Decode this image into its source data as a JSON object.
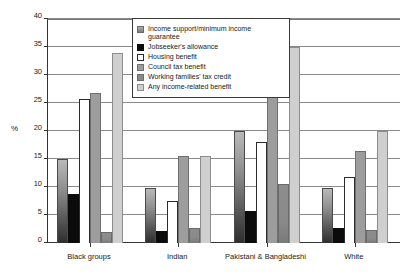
{
  "chart_data": {
    "type": "bar",
    "title": "",
    "subtitle": "",
    "xlabel": "",
    "ylabel": "%",
    "ylim": [
      0,
      40
    ],
    "ytick_step": 5,
    "yticks": [
      "0",
      "5",
      "10",
      "15",
      "20",
      "25",
      "30",
      "35",
      "40"
    ],
    "grid": true,
    "legend_position": "top-right-inside",
    "categories": [
      "Black groups",
      "Indian",
      "Pakistani & Bangladeshi",
      "White"
    ],
    "series": [
      {
        "name": "Income support/minimum income guarantee",
        "color": "#8f8f8f",
        "values": [
          15.0,
          9.9,
          20.0,
          9.9
        ]
      },
      {
        "name": "Jobseeker's allowance",
        "color": "#0b0b0b",
        "values": [
          8.8,
          2.2,
          5.7,
          2.7
        ]
      },
      {
        "name": "Housing benefit",
        "color": "#ffffff",
        "values": [
          25.8,
          7.5,
          18.0,
          11.8
        ]
      },
      {
        "name": "Council tax benefit",
        "color": "#9d9d9d",
        "values": [
          26.7,
          15.5,
          29.0,
          16.5
        ]
      },
      {
        "name": "Working families' tax credit",
        "color": "#8a8a8a",
        "values": [
          2.0,
          2.7,
          10.6,
          2.3
        ]
      },
      {
        "name": "Any income-related benefit",
        "color": "#cfcfcf",
        "values": [
          33.9,
          15.5,
          35.0,
          20.0
        ]
      }
    ]
  },
  "axis": {
    "y_title": "%"
  },
  "legend": {
    "items": [
      {
        "label": "Income support/minimum income guarantee",
        "swatch": "gradient-gray-swatch"
      },
      {
        "label": "Jobseeker's allowance",
        "swatch": "black-swatch"
      },
      {
        "label": "Housing benefit",
        "swatch": "white-swatch"
      },
      {
        "label": "Council tax benefit",
        "swatch": "mid-gray-swatch"
      },
      {
        "label": "Working families' tax credit",
        "swatch": "dark-gray-swatch"
      },
      {
        "label": "Any income-related benefit",
        "swatch": "light-gray-swatch"
      }
    ]
  }
}
